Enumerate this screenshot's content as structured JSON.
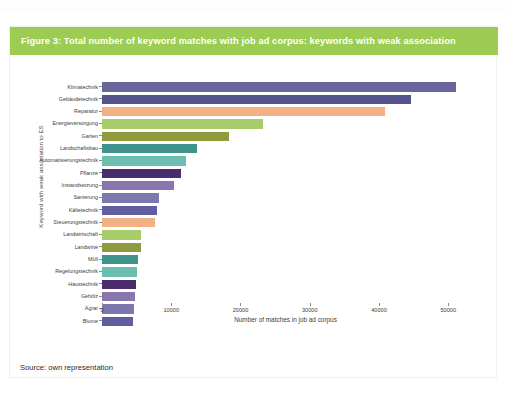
{
  "page": {
    "ghost_line": "",
    "source_note": "Source: own representation"
  },
  "figure": {
    "header": "Figure 3: Total number of keyword matches with job ad corpus: keywords with weak association",
    "header_color": "#9ccc52"
  },
  "chart_data": {
    "type": "bar",
    "orientation": "horizontal",
    "title": "Figure 3: Total number of keyword matches with job ad corpus: keywords with weak association",
    "xlabel": "Number of matches in job ad corpus",
    "ylabel": "Keyword with weak association to ES",
    "xlim": [
      0,
      53000
    ],
    "xticks": [
      0,
      10000,
      20000,
      30000,
      40000,
      50000
    ],
    "xtick_labels": [
      "0",
      "10000",
      "20000",
      "30000",
      "40000",
      "50000"
    ],
    "grid": false,
    "legend": "none",
    "categories": [
      "Klimatechnik",
      "Gebäudetechnik",
      "Reparatur",
      "Energieversorgung",
      "Garten",
      "Landschaftsbau",
      "Automatisierungstechnik",
      "Pflanze",
      "Instandsetzung",
      "Sanierung",
      "Kältetechnik",
      "Steuerungstechnik",
      "Landwirtschaft",
      "Landwirte",
      "Müll",
      "Regelungstechnik",
      "Haustechnik",
      "Gehölz",
      "Agrar",
      "Blume"
    ],
    "values": [
      51100,
      44600,
      40900,
      23300,
      18300,
      13700,
      12100,
      11400,
      10400,
      8200,
      7900,
      7700,
      5700,
      5600,
      5200,
      5100,
      4900,
      4700,
      4600,
      4500
    ],
    "colors": [
      "#6a659b",
      "#55538c",
      "#f2b184",
      "#a8cc69",
      "#8f9a3f",
      "#3f938d",
      "#6cbfb0",
      "#4a2b6b",
      "#8a76ae",
      "#7a78ad",
      "#605ea0",
      "#f2b184",
      "#a8cc69",
      "#8f9a3f",
      "#3f938d",
      "#6cbfb0",
      "#4a2b6b",
      "#8a76ae",
      "#7a78ad",
      "#605ea0"
    ]
  }
}
